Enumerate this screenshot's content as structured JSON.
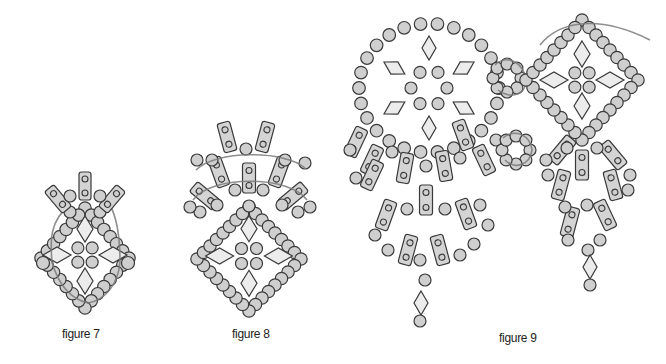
{
  "figures": [
    {
      "id": "figure-7",
      "caption": "figure 7"
    },
    {
      "id": "figure-8",
      "caption": "figure 8"
    },
    {
      "id": "figure-9",
      "caption": "figure 9"
    }
  ],
  "colors": {
    "bead_fill": "#cfcfcf",
    "outline": "#3a3a3a",
    "rhombus_fill": "#ececec",
    "thread": "#7a7a7a",
    "background": "#ffffff"
  },
  "icons": {
    "round_bead": "round-seed-bead",
    "two_hole_bar": "two-hole-bar-bead",
    "rhombus": "rhombus-bead",
    "thread_path": "thread-path-arrow"
  }
}
